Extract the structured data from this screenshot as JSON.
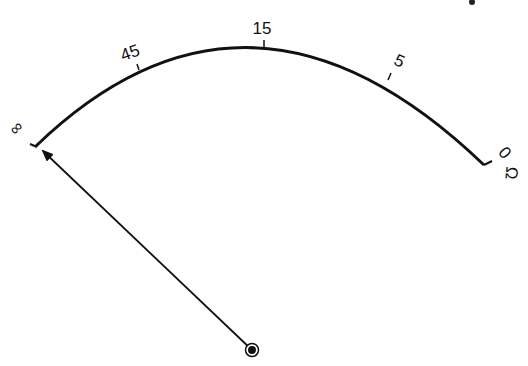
{
  "diagram": {
    "type": "ohmmeter-scale",
    "colors": {
      "ink": "#111111",
      "background": "#ffffff"
    },
    "scale": {
      "labels": [
        {
          "text": "∞",
          "x": 20,
          "y": 132,
          "rotate": -45
        },
        {
          "text": "45",
          "x": 132,
          "y": 58,
          "rotate": -20
        },
        {
          "text": "15",
          "x": 262,
          "y": 34,
          "rotate": 0
        },
        {
          "text": "5",
          "x": 397,
          "y": 66,
          "rotate": 25
        },
        {
          "text": "0",
          "x": 502,
          "y": 155,
          "rotate": 50
        }
      ],
      "unit_symbol": "Ω"
    },
    "needle": {
      "pointing_to": "∞"
    }
  }
}
